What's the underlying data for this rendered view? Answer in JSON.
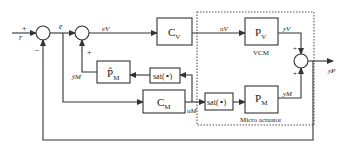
{
  "diagram": {
    "type": "block-diagram",
    "colors": {
      "line": "#333333",
      "background": "#ffffff",
      "dotted": "#555555"
    },
    "signals": {
      "r": "r",
      "e": "e",
      "e_v": "eV",
      "u_v": "uV",
      "y_v": "yV",
      "y_p": "yP",
      "y_m": "yM",
      "u_m": "uM",
      "y_m_hat": "ŷM"
    },
    "blocks": {
      "cv": {
        "main": "C",
        "sub": "V"
      },
      "pv": {
        "main": "P",
        "sub": "V"
      },
      "pm_hat": {
        "main": "P̂",
        "sub": "M"
      },
      "sat_top": {
        "label": "sat(∘)"
      },
      "cm": {
        "main": "C",
        "sub": "M"
      },
      "sat_bottom": {
        "label": "sat(∘)"
      },
      "pm": {
        "main": "P",
        "sub": "M"
      }
    },
    "group_labels": {
      "vcm": "VCM",
      "micro_actuator": "Micro actuator"
    },
    "signs": {
      "sum1_r": "+",
      "sum1_fb": "−",
      "sum2_in": "+",
      "sum3_top": "+",
      "sum3_bottom": "+"
    }
  }
}
